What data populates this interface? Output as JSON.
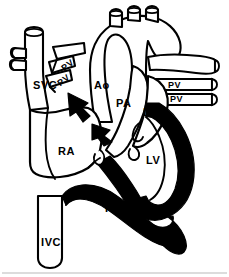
{
  "figure": {
    "width": 229,
    "height": 277,
    "style": "black-and-white line drawing",
    "background_color": "#ffffff",
    "line_color": "#000000",
    "fill_color": "#000000"
  },
  "labels": {
    "svc": "SVC",
    "ivc": "IVC",
    "ao": "Ao",
    "pa": "PA",
    "la": "LA",
    "ra": "RA",
    "lv": "LV",
    "rv": "RV",
    "pv_left_upper": "PV",
    "pv_left_lower": "PV",
    "pv_right_upper": "PV",
    "pv_right_lower": "PV"
  },
  "structures": [
    {
      "name": "superior-vena-cava",
      "abbr": "SVC",
      "shading": "white"
    },
    {
      "name": "inferior-vena-cava",
      "abbr": "IVC",
      "shading": "white"
    },
    {
      "name": "aorta",
      "abbr": "Ao",
      "shading": "white"
    },
    {
      "name": "pulmonary-artery",
      "abbr": "PA",
      "shading": "white"
    },
    {
      "name": "left-atrium",
      "abbr": "LA",
      "shading": "white"
    },
    {
      "name": "right-atrium",
      "abbr": "RA",
      "shading": "white"
    },
    {
      "name": "left-ventricle",
      "abbr": "LV",
      "shading": "black-myocardium"
    },
    {
      "name": "right-ventricle",
      "abbr": "RV",
      "shading": "black-myocardium"
    },
    {
      "name": "pulmonary-vein-left-upper",
      "abbr": "PV",
      "shading": "white"
    },
    {
      "name": "pulmonary-vein-left-lower",
      "abbr": "PV",
      "shading": "white"
    },
    {
      "name": "pulmonary-vein-right-upper",
      "abbr": "PV",
      "shading": "white"
    },
    {
      "name": "pulmonary-vein-right-lower",
      "abbr": "PV",
      "shading": "white"
    },
    {
      "name": "aortic-arch-branches",
      "abbr": "",
      "shading": "white"
    },
    {
      "name": "right-pulmonary-artery",
      "abbr": "",
      "shading": "white"
    },
    {
      "name": "left-vessel-stumps",
      "abbr": "",
      "shading": "white"
    }
  ]
}
